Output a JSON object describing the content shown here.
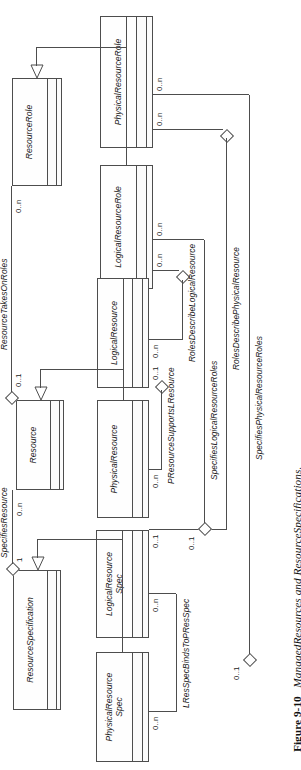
{
  "figure": {
    "number": "Figure 9-10",
    "title": "ManagedResources and ResourceSpecifications.",
    "caption": "Figure 9-10 ManagedResources and ResourceSpecifications."
  },
  "diagram": {
    "type": "uml-class-diagram",
    "orientation": "rotated-90-ccw",
    "classes": [
      {
        "id": "resource_role",
        "name": "ResourceRole",
        "abstract": true,
        "compartments": 3
      },
      {
        "id": "physical_resource_role",
        "name": "PhysicalResourceRole",
        "abstract": true,
        "compartments": 3
      },
      {
        "id": "logical_resource_role",
        "name": "LogicalResourceRole",
        "abstract": true,
        "compartments": 3
      },
      {
        "id": "resource",
        "name": "Resource",
        "abstract": true,
        "compartments": 3
      },
      {
        "id": "physical_resource",
        "name": "PhysicalResource",
        "abstract": true,
        "compartments": 3
      },
      {
        "id": "logical_resource",
        "name": "LogicalResource",
        "abstract": true,
        "compartments": 3
      },
      {
        "id": "resource_specification",
        "name": "ResourceSpecification",
        "abstract": true,
        "compartments": 3
      },
      {
        "id": "physical_resource_spec",
        "name": "PhysicalResource\nSpec",
        "abstract": true,
        "compartments": 3
      },
      {
        "id": "logical_resource_spec",
        "name": "LogicalResource\nSpec",
        "abstract": true,
        "compartments": 3
      }
    ],
    "generalizations": [
      {
        "parent": "resource_role",
        "children": [
          "physical_resource_role",
          "logical_resource_role"
        ]
      },
      {
        "parent": "resource",
        "children": [
          "physical_resource",
          "logical_resource"
        ]
      },
      {
        "parent": "resource_specification",
        "children": [
          "physical_resource_spec",
          "logical_resource_spec"
        ]
      }
    ],
    "associations": [
      {
        "id": "a1",
        "name": "ResourceTakesOnRoles",
        "from": "resource",
        "to": "resource_role",
        "from_mult": "0..1",
        "to_mult": "0..n"
      },
      {
        "id": "a2",
        "name": "SpecifiesResource",
        "from": "resource_specification",
        "to": "resource",
        "from_mult": "1",
        "to_mult": "0..n"
      },
      {
        "id": "a3",
        "name": "PResourceSupportsLResource",
        "from": "physical_resource",
        "to": "logical_resource",
        "from_mult": "0..n",
        "to_mult": "0..1"
      },
      {
        "id": "a4",
        "name": "RolesDescribeLogicalResource",
        "from": "logical_resource",
        "to": "logical_resource_role",
        "from_mult": "0..1",
        "to_mult": "0..n"
      },
      {
        "id": "a5",
        "name": "RolesDescribePhysicalResource",
        "from": "physical_resource",
        "to": "physical_resource_role",
        "from_mult": "0..1",
        "to_mult": "0..n"
      },
      {
        "id": "a6",
        "name": "SpecifiesLogicalResourceRoles",
        "from": "logical_resource_spec",
        "to": "logical_resource_role",
        "from_mult": "0..1",
        "to_mult": "0..n"
      },
      {
        "id": "a7",
        "name": "SpecifiesPhysicalResourceRoles",
        "from": "physical_resource_spec",
        "to": "physical_resource_role",
        "from_mult": "0..1",
        "to_mult": "0..n"
      },
      {
        "id": "a8",
        "name": "LResSpecBindsToPResSpec",
        "from": "logical_resource_spec",
        "to": "physical_resource_spec",
        "from_mult": "0..n",
        "to_mult": "0..n"
      }
    ],
    "multiplicity_labels": {
      "m_rr_0n": "0..n",
      "m_res_01": "0..1",
      "m_res_0n": "0..n",
      "m_rs_1": "1",
      "m_lr_01": "0..1",
      "m_lr_0n": "0..n",
      "m_pr_0n": "0..n",
      "m_pr_01": "0..1",
      "m_lrr_0n_a": "0..n",
      "m_lrr_0n_b": "0..n",
      "m_prr_0n_a": "0..n",
      "m_prr_0n_b": "0..n",
      "m_lrs_01": "0..1",
      "m_lrs_0n": "0..n",
      "m_prs_0n": "0..n",
      "m_prs_01": "0..1"
    },
    "colors": {
      "line": "#4d4d4d",
      "box_fill": "#fefefe",
      "compartment_fill": "#fbfbfb",
      "text": "#1a1a1a",
      "page": "#ffffff"
    }
  }
}
